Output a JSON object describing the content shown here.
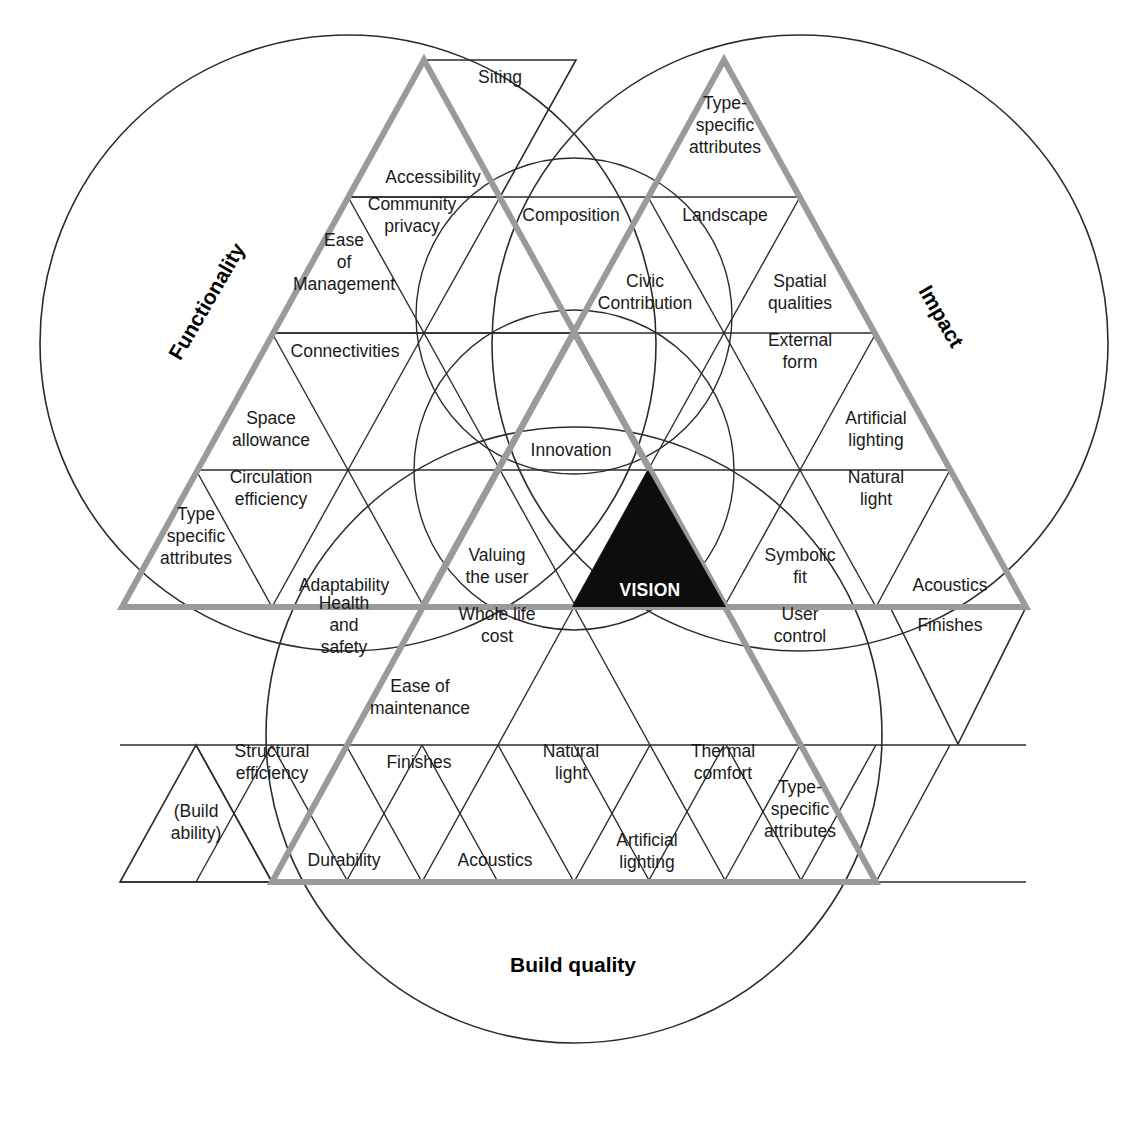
{
  "diagram": {
    "title_vision": "VISION",
    "colors": {
      "thick_edge": "#9a9a9a",
      "thin_line": "#2b2b2b",
      "vision_fill": "#0d0d0d",
      "text": "#1a1a1a",
      "background": "#ffffff"
    },
    "corner_labels": [
      {
        "id": "functionality",
        "text": "Functionality",
        "rotation": -60
      },
      {
        "id": "impact",
        "text": "Impact",
        "rotation": 60
      },
      {
        "id": "build-quality",
        "text": "Build quality",
        "rotation": 0
      }
    ],
    "outer_triangle_labels": [
      {
        "id": "siting",
        "text": "Siting"
      },
      {
        "id": "finishes-right",
        "text": "Finishes"
      },
      {
        "id": "build-ability",
        "text": "(Build ability)"
      }
    ],
    "cells": [
      {
        "id": "accessibility",
        "text": "Accessibility",
        "x": 433,
        "y": 183,
        "lines": [
          "Accessibility"
        ]
      },
      {
        "id": "community-privacy",
        "text": "Community privacy",
        "x": 412,
        "y": 221,
        "lines": [
          "Community",
          "privacy"
        ]
      },
      {
        "id": "composition",
        "text": "Composition",
        "x": 571,
        "y": 221,
        "lines": [
          "Composition"
        ]
      },
      {
        "id": "type-specific-attributes-top",
        "text": "Type-specific attributes",
        "x": 725,
        "y": 131,
        "lines": [
          "Type-",
          "specific",
          "attributes"
        ]
      },
      {
        "id": "landscape",
        "text": "Landscape",
        "x": 725,
        "y": 221,
        "lines": [
          "Landscape"
        ]
      },
      {
        "id": "ease-of-management",
        "text": "Ease of Management",
        "x": 344,
        "y": 268,
        "lines": [
          "Ease",
          "of",
          "Management"
        ]
      },
      {
        "id": "civic-contribution",
        "text": "Civic Contribution",
        "x": 645,
        "y": 298,
        "lines": [
          "Civic",
          "Contribution"
        ]
      },
      {
        "id": "spatial-qualities",
        "text": "Spatial qualities",
        "x": 800,
        "y": 298,
        "lines": [
          "Spatial",
          "qualities"
        ]
      },
      {
        "id": "connectivities",
        "text": "Connectivities",
        "x": 345,
        "y": 357,
        "lines": [
          "Connectivities"
        ]
      },
      {
        "id": "external-form",
        "text": "External form",
        "x": 800,
        "y": 357,
        "lines": [
          "External",
          "form"
        ]
      },
      {
        "id": "space-allowance",
        "text": "Space allowance",
        "x": 271,
        "y": 435,
        "lines": [
          "Space",
          "allowance"
        ]
      },
      {
        "id": "innovation",
        "text": "Innovation",
        "x": 571,
        "y": 456,
        "lines": [
          "Innovation"
        ]
      },
      {
        "id": "artificial-lighting-right",
        "text": "Artificial lighting",
        "x": 876,
        "y": 435,
        "lines": [
          "Artificial",
          "lighting"
        ]
      },
      {
        "id": "circulation-efficiency",
        "text": "Circulation efficiency",
        "x": 271,
        "y": 494,
        "lines": [
          "Circulation",
          "efficiency"
        ]
      },
      {
        "id": "natural-light-right",
        "text": "Natural light",
        "x": 876,
        "y": 494,
        "lines": [
          "Natural",
          "light"
        ]
      },
      {
        "id": "type-specific-attributes-left",
        "text": "Type specific attributes",
        "x": 196,
        "y": 542,
        "lines": [
          "Type",
          "specific",
          "attributes"
        ]
      },
      {
        "id": "adaptability",
        "text": "Adaptability",
        "x": 344,
        "y": 591,
        "lines": [
          "Adaptability"
        ]
      },
      {
        "id": "valuing-the-user",
        "text": "Valuing the user",
        "x": 497,
        "y": 572,
        "lines": [
          "Valuing",
          "the user"
        ]
      },
      {
        "id": "symbolic-fit",
        "text": "Symbolic fit",
        "x": 800,
        "y": 572,
        "lines": [
          "Symbolic",
          "fit"
        ]
      },
      {
        "id": "acoustics-right",
        "text": "Acoustics",
        "x": 950,
        "y": 591,
        "lines": [
          "Acoustics"
        ]
      },
      {
        "id": "health-and-safety",
        "text": "Health and safety",
        "x": 344,
        "y": 631,
        "lines": [
          "Health",
          "and",
          "safety"
        ]
      },
      {
        "id": "whole-life-cost",
        "text": "Whole life cost",
        "x": 497,
        "y": 631,
        "lines": [
          "Whole life",
          "cost"
        ]
      },
      {
        "id": "user-control",
        "text": "User control",
        "x": 800,
        "y": 631,
        "lines": [
          "User",
          "control"
        ]
      },
      {
        "id": "finishes-edge",
        "text": "Finishes",
        "x": 950,
        "y": 631,
        "lines": [
          "Finishes"
        ]
      },
      {
        "id": "ease-of-maintenance",
        "text": "Ease of maintenance",
        "x": 420,
        "y": 703,
        "lines": [
          "Ease of",
          "maintenance"
        ]
      },
      {
        "id": "structural-efficiency",
        "text": "Structural efficiency",
        "x": 272,
        "y": 768,
        "lines": [
          "Structural",
          "efficiency"
        ]
      },
      {
        "id": "finishes-bottom",
        "text": "Finishes",
        "x": 419,
        "y": 768,
        "lines": [
          "Finishes"
        ]
      },
      {
        "id": "natural-light-bottom",
        "text": "Natural light",
        "x": 571,
        "y": 768,
        "lines": [
          "Natural",
          "light"
        ]
      },
      {
        "id": "thermal-comfort",
        "text": "Thermal comfort",
        "x": 723,
        "y": 768,
        "lines": [
          "Thermal",
          "comfort"
        ]
      },
      {
        "id": "type-specific-attributes-bottom",
        "text": "Type-specific attributes",
        "x": 800,
        "y": 815,
        "lines": [
          "Type-",
          "specific",
          "attributes"
        ]
      },
      {
        "id": "build-ability-cell",
        "text": "(Build ability)",
        "x": 196,
        "y": 828,
        "lines": [
          "(Build",
          "ability)"
        ]
      },
      {
        "id": "durability",
        "text": "Durability",
        "x": 344,
        "y": 866,
        "lines": [
          "Durability"
        ]
      },
      {
        "id": "acoustics-bottom",
        "text": "Acoustics",
        "x": 495,
        "y": 866,
        "lines": [
          "Acoustics"
        ]
      },
      {
        "id": "artificial-lighting-bottom",
        "text": "Artificial lighting",
        "x": 647,
        "y": 857,
        "lines": [
          "Artificial",
          "lighting"
        ]
      },
      {
        "id": "siting-cell",
        "text": "Siting",
        "x": 500,
        "y": 83,
        "lines": [
          "Siting"
        ]
      }
    ]
  }
}
